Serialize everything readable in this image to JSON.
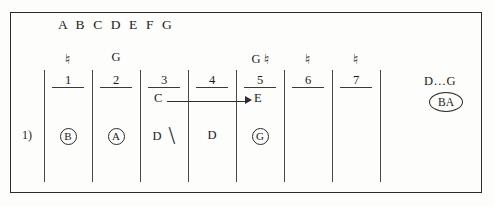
{
  "figure": {
    "header": "A B C D E F G",
    "index_label": "1)"
  },
  "columns": [
    {
      "number": "1",
      "symbol": "♮",
      "symbol_letter": "",
      "sub_letter": "",
      "entry": "B",
      "entry_style": "circled"
    },
    {
      "number": "2",
      "symbol": "",
      "symbol_letter": "G",
      "sub_letter": "",
      "entry": "A",
      "entry_style": "circled"
    },
    {
      "number": "3",
      "symbol": "",
      "symbol_letter": "",
      "sub_letter": "C",
      "entry": "D",
      "entry_style": "plain-mark"
    },
    {
      "number": "4",
      "symbol": "",
      "symbol_letter": "",
      "sub_letter": "",
      "entry": "D",
      "entry_style": "plain"
    },
    {
      "number": "5",
      "symbol": "♮",
      "symbol_letter": "G",
      "sub_letter": "E",
      "entry": "G",
      "entry_style": "circled"
    },
    {
      "number": "6",
      "symbol": "♮",
      "symbol_letter": "",
      "sub_letter": "",
      "entry": "",
      "entry_style": "empty"
    },
    {
      "number": "7",
      "symbol": "♮",
      "symbol_letter": "",
      "sub_letter": "",
      "entry": "",
      "entry_style": "empty"
    }
  ],
  "arrow": {
    "from": "C",
    "to": "E"
  },
  "right_annotations": {
    "range": "D…G",
    "ellipse_tag": "BA"
  },
  "colors": {
    "ink": "#1b1b1b",
    "rule": "#3a3a3a",
    "frame": "#2b2b2b",
    "paper": "#fdfdfc"
  }
}
